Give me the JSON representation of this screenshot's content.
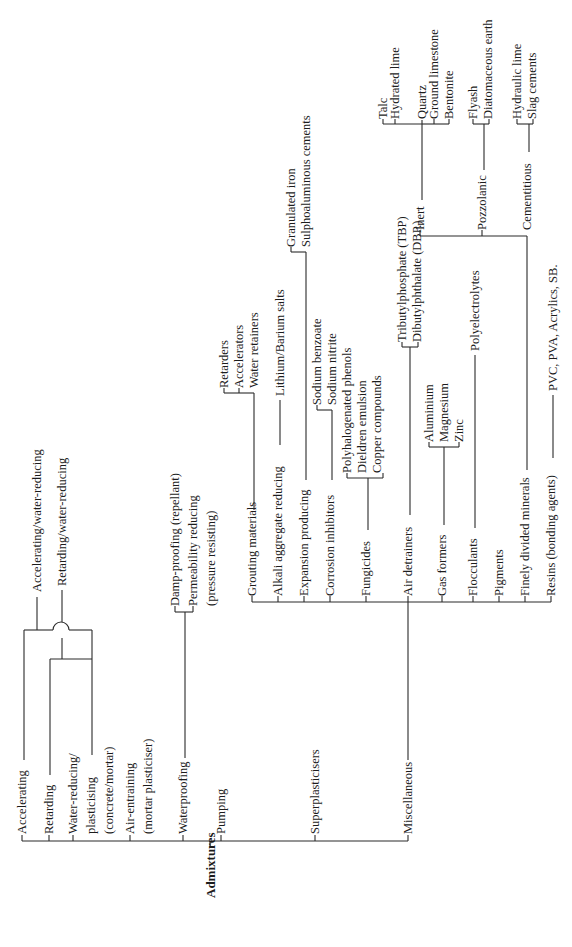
{
  "diagram": {
    "title": "Admixtures",
    "orientation": "rotated-90-ccw",
    "line_color": "#2a2a2a",
    "text_color": "#1c1c1c",
    "root": "Admixtures",
    "branches": {
      "accelerating": "Accelerating",
      "retarding": "Retarding",
      "water_reducing": [
        "Water-reducing/",
        "plasticising",
        "(concrete/mortar)"
      ],
      "air_entraining": [
        "Air-entraining",
        "(mortar plasticiser)"
      ],
      "waterproofing": "Waterproofing",
      "pumping": "Pumping",
      "superplasticisers": "Superplasticisers",
      "miscellaneous": "Miscellaneous"
    },
    "combinations": {
      "accelerating_water_reducing": "Accelerating/water-reducing",
      "retarding_water_reducing": "Retarding/water-reducing"
    },
    "waterproofing_children": {
      "damp_proofing": "Damp-proofing (repellant)",
      "permeability_reducing": [
        "Permeability reducing",
        "(pressure resisting)"
      ]
    },
    "miscellaneous_children": {
      "grouting": "Grouting materials",
      "alkali": "Alkali aggregate reducing",
      "expansion": "Expansion producing",
      "corrosion": "Corrosion inhibitors",
      "fungicides": "Fungicides",
      "air_detrainers": "Air detrainers",
      "gas_formers": "Gas formers",
      "flocculants": "Flocculants",
      "pigments": "Pigments",
      "finely_divided": "Finely divided minerals",
      "resins": "Resins (bonding agents)"
    },
    "grouting_children": [
      "Retarders",
      "Accelerators",
      "Water retainers"
    ],
    "alkali_children": [
      "Lithium/Barium salts"
    ],
    "expansion_children": [
      "Granulated iron",
      "Sulphoaluminous cements"
    ],
    "corrosion_children": [
      "Sodium benzoate",
      "Sodium nitrite"
    ],
    "fungicides_children": [
      "Polyhalogenated phenols",
      "Dieldren emulsion",
      "Copper compounds"
    ],
    "air_detrainers_children": [
      "Tributylphosphate (TBP)",
      "Dibutylphthalate (DBP.)"
    ],
    "gas_formers_children": [
      "Aluminium",
      "Magnesium",
      "Zinc"
    ],
    "flocculants_children": [
      "Polyelectrolytes"
    ],
    "finely_divided_children": {
      "inert": "Inert",
      "pozzolanic": "Pozzolanic",
      "cementitious": "Cementitious"
    },
    "inert_children": [
      "Talc",
      "Hydrated lime",
      "Quartz",
      "Ground limestone",
      "Bentonite"
    ],
    "pozzolanic_children": [
      "Flyash",
      "Diatomaceous earth"
    ],
    "cementitious_children": [
      "Hydraulic lime",
      "Slag cements"
    ],
    "resins_children": [
      "PVC, PVA, Acrylics, SB."
    ]
  }
}
